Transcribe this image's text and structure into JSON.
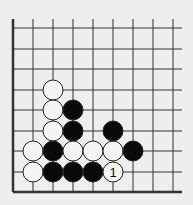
{
  "diagram": {
    "type": "go-board-corner",
    "background": "#eeeeec",
    "line_color": "#333333",
    "grid": {
      "columns_x": [
        13,
        33,
        53,
        73,
        93,
        113,
        133,
        153,
        173
      ],
      "rows_y": [
        28,
        49,
        69,
        90,
        110,
        131,
        151,
        172,
        192
      ],
      "line_top": 19,
      "line_right": 182,
      "left_edge_thick": true,
      "bottom_edge_thick": true
    },
    "stone_radius": 10,
    "stones": [
      {
        "color": "white",
        "col": 2,
        "row": 3
      },
      {
        "color": "white",
        "col": 2,
        "row": 4
      },
      {
        "color": "white",
        "col": 2,
        "row": 5
      },
      {
        "color": "white",
        "col": 1,
        "row": 6
      },
      {
        "color": "white",
        "col": 1,
        "row": 7
      },
      {
        "color": "black",
        "col": 3,
        "row": 4
      },
      {
        "color": "black",
        "col": 3,
        "row": 5
      },
      {
        "color": "black",
        "col": 2,
        "row": 6
      },
      {
        "color": "black",
        "col": 2,
        "row": 7
      },
      {
        "color": "black",
        "col": 3,
        "row": 7
      },
      {
        "color": "black",
        "col": 4,
        "row": 7
      },
      {
        "color": "white",
        "col": 3,
        "row": 6
      },
      {
        "color": "white",
        "col": 4,
        "row": 6
      },
      {
        "color": "white",
        "col": 5,
        "row": 6
      },
      {
        "color": "white",
        "col": 5,
        "row": 7,
        "label": "1"
      },
      {
        "color": "black",
        "col": 5,
        "row": 5
      },
      {
        "color": "black",
        "col": 6,
        "row": 6
      }
    ]
  }
}
